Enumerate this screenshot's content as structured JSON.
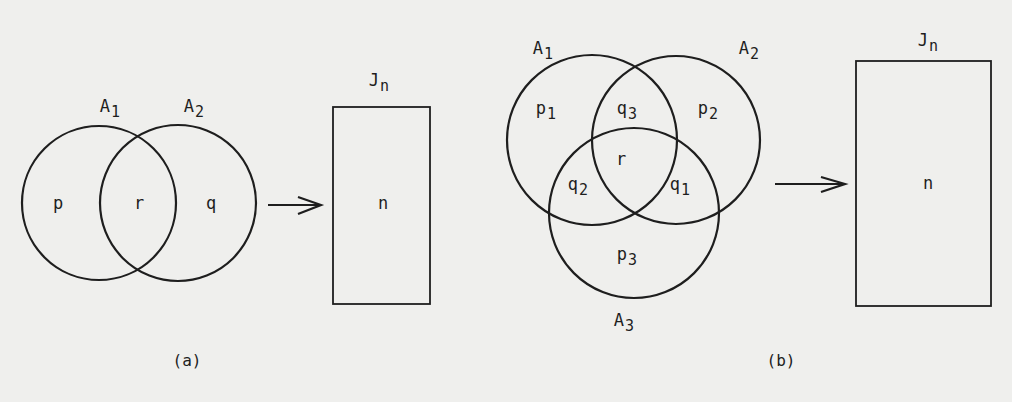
{
  "figure": {
    "panel_a": {
      "caption": "(a)",
      "sets": [
        {
          "name": "A",
          "subscript": "1"
        },
        {
          "name": "A",
          "subscript": "2"
        }
      ],
      "regions": {
        "only_A1": "p",
        "intersection": "r",
        "only_A2": "q"
      },
      "arrow": "maps-to",
      "target": {
        "name": "J",
        "subscript": "n",
        "content": "n"
      }
    },
    "panel_b": {
      "caption": "(b)",
      "sets": [
        {
          "name": "A",
          "subscript": "1"
        },
        {
          "name": "A",
          "subscript": "2"
        },
        {
          "name": "A",
          "subscript": "3"
        }
      ],
      "regions": {
        "only_A1": {
          "name": "p",
          "subscript": "1"
        },
        "only_A2": {
          "name": "p",
          "subscript": "2"
        },
        "only_A3": {
          "name": "p",
          "subscript": "3"
        },
        "A1_A2": {
          "name": "q",
          "subscript": "3"
        },
        "A1_A3": {
          "name": "q",
          "subscript": "2"
        },
        "A2_A3": {
          "name": "q",
          "subscript": "1"
        },
        "all": "r"
      },
      "arrow": "maps-to",
      "target": {
        "name": "J",
        "subscript": "n",
        "content": "n"
      }
    }
  },
  "colors": {
    "background": "#efefed",
    "ink": "#1e1e1e"
  }
}
